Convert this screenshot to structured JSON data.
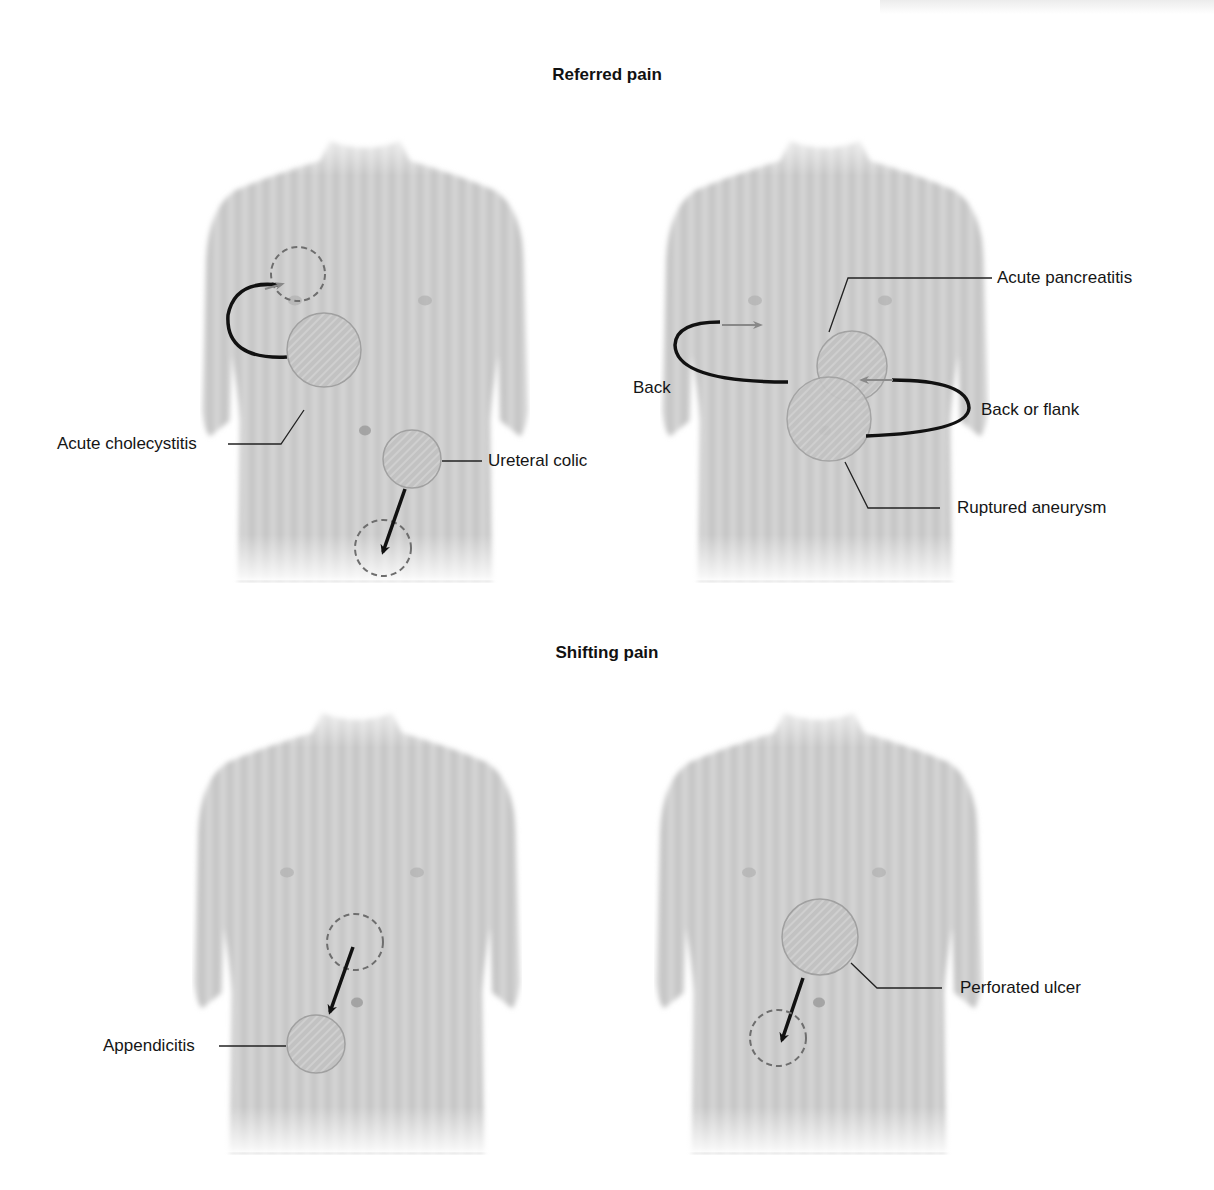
{
  "figure": {
    "sections": [
      {
        "title": "Referred pain"
      },
      {
        "title": "Shifting pain"
      }
    ],
    "panels": [
      {
        "id": "referred-left",
        "labels": {
          "cholecystitis": "Acute cholecystitis",
          "ureteral": "Ureteral colic"
        }
      },
      {
        "id": "referred-right",
        "labels": {
          "pancreatitis": "Acute pancreatitis",
          "back": "Back",
          "back_flank": "Back or flank",
          "aneurysm": "Ruptured aneurysm"
        }
      },
      {
        "id": "shifting-left",
        "labels": {
          "appendicitis": "Appendicitis"
        }
      },
      {
        "id": "shifting-right",
        "labels": {
          "ulcer": "Perforated ulcer"
        }
      }
    ],
    "colors": {
      "torso": "#c9c9c9",
      "torso_dark": "#b3b3b3",
      "region_fill": "#bdbdbd",
      "region_stroke": "#a8a8a8",
      "dashed": "#6e6e6e",
      "arrow": "#111111",
      "arrow_light": "#8a8a8a",
      "leader": "#222222"
    }
  }
}
